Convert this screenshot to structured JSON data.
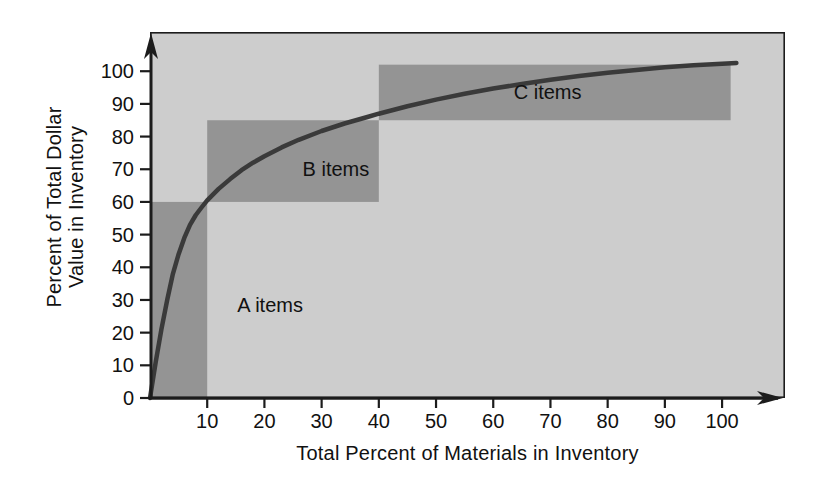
{
  "chart_data": {
    "type": "line",
    "xlabel": "Total Percent of Materials in Inventory",
    "ylabel_lines": [
      "Percent of Total Dollar",
      "Value in Inventory"
    ],
    "x_ticks": [
      10,
      20,
      30,
      40,
      50,
      60,
      70,
      80,
      90,
      100
    ],
    "y_ticks": [
      0,
      10,
      20,
      30,
      40,
      50,
      60,
      70,
      80,
      90,
      100
    ],
    "xlim": [
      0,
      111
    ],
    "ylim": [
      0,
      112
    ],
    "grid": false,
    "legend": "none",
    "curve": {
      "name": "cumulative-dollar-value-curve",
      "points": [
        [
          0,
          0
        ],
        [
          1,
          11
        ],
        [
          2,
          21
        ],
        [
          3,
          30
        ],
        [
          4,
          38
        ],
        [
          5,
          44
        ],
        [
          6,
          49
        ],
        [
          7,
          53
        ],
        [
          8,
          56
        ],
        [
          9,
          58.3
        ],
        [
          10,
          60.5
        ],
        [
          12,
          64
        ],
        [
          14,
          67
        ],
        [
          16,
          69.7
        ],
        [
          18,
          72
        ],
        [
          20,
          74
        ],
        [
          23,
          76.7
        ],
        [
          26,
          79
        ],
        [
          30,
          81.7
        ],
        [
          34,
          84
        ],
        [
          38,
          86
        ],
        [
          40,
          87
        ],
        [
          45,
          89.3
        ],
        [
          50,
          91.3
        ],
        [
          55,
          93.1
        ],
        [
          60,
          94.7
        ],
        [
          65,
          96.1
        ],
        [
          70,
          97.4
        ],
        [
          75,
          98.5
        ],
        [
          80,
          99.5
        ],
        [
          85,
          100.4
        ],
        [
          90,
          101.2
        ],
        [
          95,
          101.8
        ],
        [
          100,
          102.3
        ],
        [
          102.5,
          102.5
        ]
      ]
    },
    "regions": [
      {
        "label": "A items",
        "x": [
          0,
          10
        ],
        "y": [
          0,
          60
        ],
        "label_at": [
          21,
          28.5
        ]
      },
      {
        "label": "B items",
        "x": [
          10,
          40
        ],
        "y": [
          60,
          85
        ],
        "label_at": [
          32.5,
          70
        ]
      },
      {
        "label": "C items",
        "x": [
          40,
          101.5
        ],
        "y": [
          85,
          102
        ],
        "label_at": [
          69.5,
          93.5
        ]
      }
    ],
    "colors": {
      "page_bg": "#ffffff",
      "plot_bg": "#cdcdcd",
      "region_fill": "#949494",
      "curve": "#3a3a3a",
      "axis": "#1c1c1c",
      "text": "#111111"
    }
  }
}
